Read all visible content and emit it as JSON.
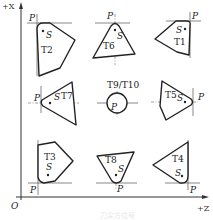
{
  "diagram": {
    "type": "tool-nose-orientation",
    "axes": {
      "vertical_label": "+X",
      "horizontal_label": "+Z",
      "origin_label": "O"
    },
    "point_labels": {
      "tip": "P",
      "center": "S"
    },
    "tools": [
      {
        "id": "T2",
        "label": "T2",
        "row": 1,
        "col": 1
      },
      {
        "id": "T6",
        "label": "T6",
        "row": 1,
        "col": 2
      },
      {
        "id": "T1",
        "label": "T1",
        "row": 1,
        "col": 3
      },
      {
        "id": "T7",
        "label": "T7",
        "row": 2,
        "col": 1
      },
      {
        "id": "T9/T10",
        "label": "T9/T10",
        "row": 2,
        "col": 2
      },
      {
        "id": "T5",
        "label": "T5",
        "row": 2,
        "col": 3
      },
      {
        "id": "T3",
        "label": "T3",
        "row": 3,
        "col": 1
      },
      {
        "id": "T8",
        "label": "T8",
        "row": 3,
        "col": 2
      },
      {
        "id": "T4",
        "label": "T4",
        "row": 3,
        "col": 3
      }
    ],
    "caption": "刀尖方位号"
  }
}
